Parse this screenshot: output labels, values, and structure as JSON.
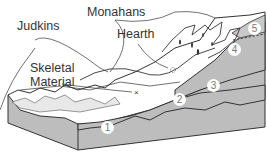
{
  "diagram": {
    "labels": {
      "judkins": "Judkins",
      "monahans": "Monahans",
      "hearth": "Hearth",
      "skeletal_line1": "Skeletal",
      "skeletal_line2": "Material"
    },
    "layers": [
      {
        "number": "1"
      },
      {
        "number": "2"
      },
      {
        "number": "3"
      },
      {
        "number": "4"
      },
      {
        "number": "5"
      }
    ],
    "markers": {
      "skeletal_material_symbol": "×",
      "hearth_symbol": "hearth"
    },
    "colors": {
      "stratum_fill": "#bdbdbd",
      "surface_fill": "#ffffff",
      "line": "#333333"
    }
  }
}
